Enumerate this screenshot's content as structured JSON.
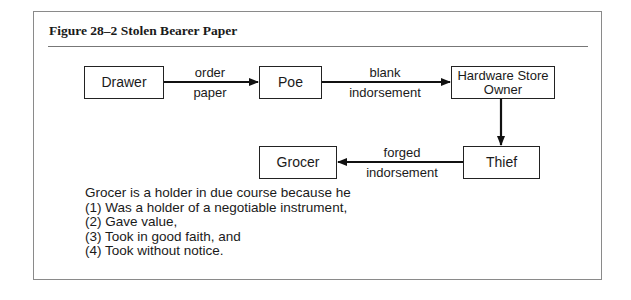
{
  "figure": {
    "title": "Figure 28–2  Stolen Bearer Paper"
  },
  "nodes": {
    "drawer": "Drawer",
    "poe": "Poe",
    "hardware_store_owner": "Hardware Store Owner",
    "thief": "Thief",
    "grocer": "Grocer"
  },
  "edges": [
    {
      "from": "Drawer",
      "to": "Poe",
      "label_top": "order",
      "label_bottom": "paper"
    },
    {
      "from": "Poe",
      "to": "Hardware Store Owner",
      "label_top": "blank",
      "label_bottom": "indorsement"
    },
    {
      "from": "Hardware Store Owner",
      "to": "Thief",
      "label_top": "",
      "label_bottom": ""
    },
    {
      "from": "Thief",
      "to": "Grocer",
      "label_top": "forged",
      "label_bottom": "indorsement"
    }
  ],
  "notes": {
    "lines": [
      "Grocer is a holder in due course because he",
      "(1) Was a holder of a negotiable instrument,",
      "(2) Gave value,",
      "(3) Took in good faith, and",
      "(4) Took without notice."
    ]
  }
}
